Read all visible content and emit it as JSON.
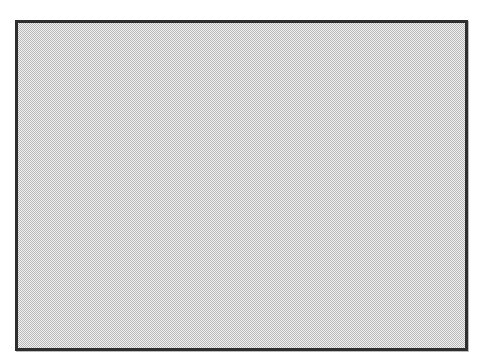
{
  "swatch": {
    "pattern": "checkerboard-dither",
    "border_color": "#2e2e2e",
    "fill_color_dark": "#a8a8a8",
    "fill_color_light": "#ffffff",
    "background_color": "#ffffff"
  }
}
